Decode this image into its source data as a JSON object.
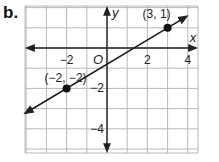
{
  "problem_label": "b.",
  "chart_data": {
    "type": "line",
    "title": "",
    "xlabel": "x",
    "ylabel": "y",
    "origin_label": "O",
    "x_ticks": [
      -2,
      2,
      4
    ],
    "y_ticks": [
      -2,
      -4
    ],
    "x_tick_labels": [
      "−2",
      "2",
      "4"
    ],
    "y_tick_labels": [
      "−2",
      "−4"
    ],
    "xlim": [
      -4,
      4.5
    ],
    "ylim": [
      -5.2,
      2
    ],
    "grid": true,
    "grid_step": 1,
    "series": [
      {
        "name": "line through (-2,-2) and (3,1)",
        "slope": 0.6,
        "intercept": -0.8,
        "points": [
          {
            "x": -2,
            "y": -2,
            "label": "(−2, −2)"
          },
          {
            "x": 3,
            "y": 1,
            "label": "(3, 1)"
          }
        ],
        "arrows_both_ends": true
      }
    ]
  },
  "colors": {
    "grid": "#b8b8b8",
    "axis": "#222222",
    "line": "#1a1a1a",
    "point": "#111111",
    "background": "#ffffff"
  }
}
